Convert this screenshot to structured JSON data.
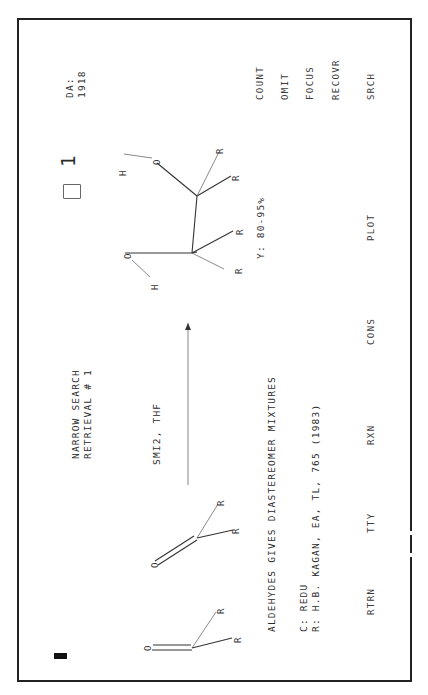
{
  "header": {
    "mode_line1": "NARROW SEARCH",
    "mode_line2": "RETRIEVAL # 1",
    "da_label": "DA:",
    "da_value": "1918",
    "hit_count": "1"
  },
  "reaction": {
    "reagents": "SMI2, THF",
    "reactant1_atoms": [
      "O",
      "R",
      "R"
    ],
    "reactant2_atoms": [
      "O",
      "R",
      "R"
    ],
    "product_atoms": [
      "H",
      "O",
      "R",
      "R",
      "H",
      "O",
      "R",
      "R"
    ],
    "yield": "Y: 80-95%",
    "comment": "ALDEHYDES GIVES DIASTEREOMER MIXTURES",
    "class_line": "C: REDU",
    "reference_line": "R: H.B. KAGAN, EA, TL, 765 (1983)"
  },
  "side_menu": {
    "items": [
      "COUNT",
      "OMIT",
      "FOCUS",
      "RECOVR"
    ]
  },
  "bottom_menu": {
    "items": [
      "RTRN",
      "TTY",
      "RXN",
      "CONS",
      "PLOT",
      "SRCH"
    ]
  },
  "icons": {
    "box": "square-icon",
    "cursor": "cursor-block"
  }
}
